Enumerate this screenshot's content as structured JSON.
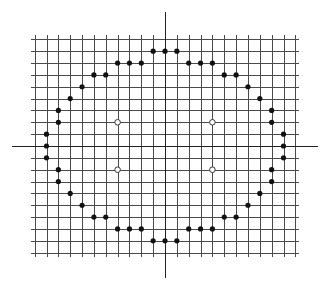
{
  "diagram": {
    "type": "lattice-point-plot",
    "colors": {
      "background": "#ffffff",
      "grid": "#4a4a4a",
      "axis": "#222222",
      "filled_point": "#111111",
      "open_point_stroke": "#333333"
    },
    "grid": {
      "x_range": [
        -11,
        11
      ],
      "y_range": [
        -9,
        9
      ],
      "cell_px": 11.85,
      "origin_px": [
        165,
        146
      ],
      "line_overhang_px": 4
    },
    "axes": {
      "x_axis_px": [
        12,
        318
      ],
      "y_axis_px": [
        12,
        278
      ]
    },
    "filled_points": [
      [
        -1,
        8
      ],
      [
        0,
        8
      ],
      [
        1,
        8
      ],
      [
        -4,
        7
      ],
      [
        -3,
        7
      ],
      [
        -2,
        7
      ],
      [
        2,
        7
      ],
      [
        3,
        7
      ],
      [
        4,
        7
      ],
      [
        -6,
        6
      ],
      [
        -5,
        6
      ],
      [
        5,
        6
      ],
      [
        6,
        6
      ],
      [
        -7,
        5
      ],
      [
        7,
        5
      ],
      [
        -8,
        4
      ],
      [
        8,
        4
      ],
      [
        -9,
        3
      ],
      [
        9,
        3
      ],
      [
        -9,
        2
      ],
      [
        9,
        2
      ],
      [
        -10,
        1
      ],
      [
        10,
        1
      ],
      [
        -10,
        0
      ],
      [
        10,
        0
      ],
      [
        -10,
        -1
      ],
      [
        10,
        -1
      ],
      [
        -9,
        -2
      ],
      [
        9,
        -2
      ],
      [
        -9,
        -3
      ],
      [
        9,
        -3
      ],
      [
        -8,
        -4
      ],
      [
        8,
        -4
      ],
      [
        -7,
        -5
      ],
      [
        7,
        -5
      ],
      [
        -6,
        -6
      ],
      [
        -5,
        -6
      ],
      [
        5,
        -6
      ],
      [
        6,
        -6
      ],
      [
        -4,
        -7
      ],
      [
        -3,
        -7
      ],
      [
        -2,
        -7
      ],
      [
        2,
        -7
      ],
      [
        3,
        -7
      ],
      [
        4,
        -7
      ],
      [
        -1,
        -8
      ],
      [
        0,
        -8
      ],
      [
        1,
        -8
      ]
    ],
    "open_points": [
      [
        -4,
        2
      ],
      [
        4,
        2
      ],
      [
        -4,
        -2
      ],
      [
        4,
        -2
      ]
    ]
  }
}
